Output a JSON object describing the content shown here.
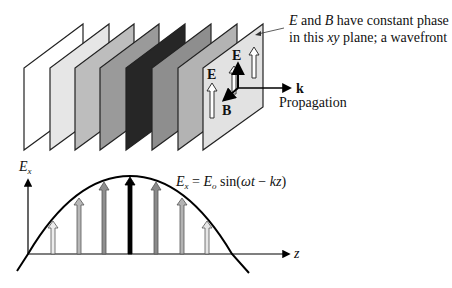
{
  "wavefront_planes": {
    "count": 8,
    "fills": [
      "#ffffff",
      "#e6e6e6",
      "#bdbdbd",
      "#9a9a9a",
      "#262626",
      "#8e8e8e",
      "#b3b3b3",
      "#e2e2e2"
    ],
    "stroke": "#222222"
  },
  "annotation": {
    "line1_E": "E",
    "line1_and": " and ",
    "line1_B": "B",
    "line1_rest": " have constant phase",
    "line2_pre": "in this ",
    "line2_xy": "xy",
    "line2_post": " plane; a wavefront"
  },
  "vectors": {
    "E_label": "E",
    "E_label_side": "E",
    "B_label": "B",
    "k_label": "k",
    "propagation_label": "Propagation"
  },
  "graph": {
    "y_axis_label_main": "E",
    "y_axis_label_sub": "x",
    "x_axis_label": "z",
    "equation": {
      "lhs_main": "E",
      "lhs_sub": "x",
      "eq": " = ",
      "rhs_main": "E",
      "rhs_sub": "o",
      "func": " sin(",
      "omega_t": "ωt",
      "minus": " − ",
      "kz": "kz",
      "close": ")"
    },
    "field_arrows": {
      "x": [
        53,
        79,
        104,
        130,
        156,
        182,
        207
      ],
      "fills": [
        "#ececec",
        "#b8b8b8",
        "#8f8f8f",
        "#000000",
        "#8a8a8a",
        "#b3b3b3",
        "#e6e6e6"
      ]
    }
  }
}
